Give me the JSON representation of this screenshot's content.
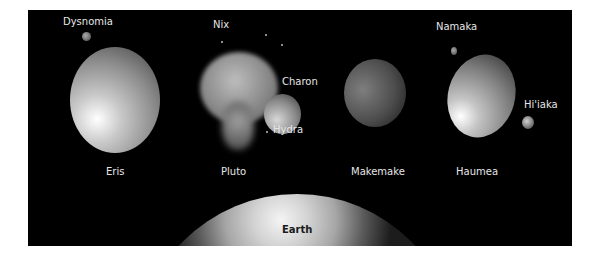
{
  "figure": {
    "bodies": [
      {
        "id": "eris",
        "label": "Eris"
      },
      {
        "id": "pluto",
        "label": "Pluto"
      },
      {
        "id": "makemake",
        "label": "Makemake"
      },
      {
        "id": "haumea",
        "label": "Haumea"
      },
      {
        "id": "earth",
        "label": "Earth"
      }
    ],
    "moons": [
      {
        "id": "dysnomia",
        "label": "Dysnomia",
        "parent": "Eris"
      },
      {
        "id": "nix",
        "label": "Nix",
        "parent": "Pluto"
      },
      {
        "id": "charon",
        "label": "Charon",
        "parent": "Pluto"
      },
      {
        "id": "hydra",
        "label": "Hydra",
        "parent": "Pluto"
      },
      {
        "id": "namaka",
        "label": "Namaka",
        "parent": "Haumea"
      },
      {
        "id": "hiiaka",
        "label": "Hi'iaka",
        "parent": "Haumea"
      }
    ],
    "colors": {
      "background": "#000000",
      "label": "#e6e6e6",
      "earth_label": "#1a1a1a",
      "page": "#ffffff"
    }
  }
}
